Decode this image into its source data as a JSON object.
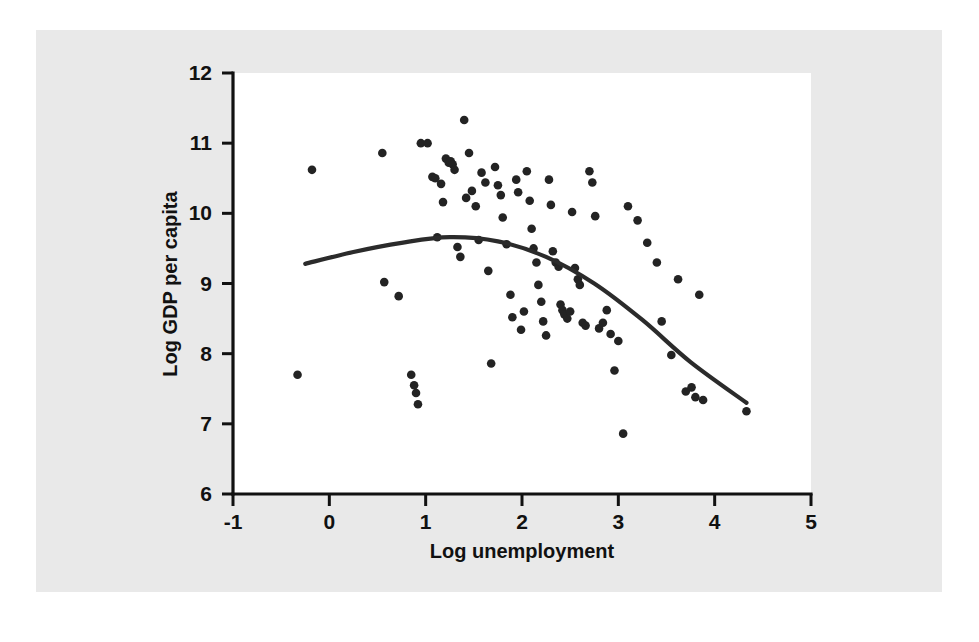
{
  "figure": {
    "background_color": "#e9e9e9",
    "panel_color": "#ffffff",
    "ink_color": "#232323"
  },
  "chart_data": {
    "type": "scatter",
    "title": "",
    "xlabel": "Log unemployment",
    "ylabel": "Log GDP per capita",
    "xlim": [
      -1,
      5
    ],
    "ylim": [
      6,
      12
    ],
    "xticks": [
      -1,
      0,
      1,
      2,
      3,
      4,
      5
    ],
    "xtick_labels": [
      "-1",
      "0",
      "1",
      "2",
      "3",
      "4",
      "5"
    ],
    "yticks": [
      6,
      7,
      8,
      9,
      10,
      11,
      12
    ],
    "ytick_labels": [
      "6",
      "7",
      "8",
      "9",
      "10",
      "11",
      "12"
    ],
    "grid": false,
    "legend": null,
    "marker": "filled-circle",
    "points": [
      [
        -0.33,
        7.7
      ],
      [
        -0.18,
        10.62
      ],
      [
        0.55,
        10.86
      ],
      [
        0.57,
        9.02
      ],
      [
        0.72,
        8.82
      ],
      [
        0.85,
        7.7
      ],
      [
        0.88,
        7.55
      ],
      [
        0.9,
        7.44
      ],
      [
        0.92,
        7.28
      ],
      [
        0.95,
        11.0
      ],
      [
        1.02,
        11.0
      ],
      [
        1.07,
        10.52
      ],
      [
        1.1,
        10.5
      ],
      [
        1.12,
        9.66
      ],
      [
        1.16,
        10.42
      ],
      [
        1.18,
        10.16
      ],
      [
        1.21,
        10.78
      ],
      [
        1.24,
        10.72
      ],
      [
        1.26,
        10.74
      ],
      [
        1.28,
        10.7
      ],
      [
        1.3,
        10.62
      ],
      [
        1.33,
        9.52
      ],
      [
        1.36,
        9.38
      ],
      [
        1.4,
        11.33
      ],
      [
        1.42,
        10.22
      ],
      [
        1.45,
        10.86
      ],
      [
        1.48,
        10.32
      ],
      [
        1.52,
        10.1
      ],
      [
        1.55,
        9.62
      ],
      [
        1.58,
        10.58
      ],
      [
        1.62,
        10.44
      ],
      [
        1.65,
        9.18
      ],
      [
        1.68,
        7.86
      ],
      [
        1.72,
        10.66
      ],
      [
        1.75,
        10.4
      ],
      [
        1.78,
        10.26
      ],
      [
        1.8,
        9.94
      ],
      [
        1.84,
        9.56
      ],
      [
        1.88,
        8.84
      ],
      [
        1.9,
        8.52
      ],
      [
        1.94,
        10.48
      ],
      [
        1.96,
        10.3
      ],
      [
        1.99,
        8.34
      ],
      [
        2.02,
        8.6
      ],
      [
        2.05,
        10.6
      ],
      [
        2.08,
        10.18
      ],
      [
        2.1,
        9.78
      ],
      [
        2.12,
        9.5
      ],
      [
        2.15,
        9.3
      ],
      [
        2.17,
        8.98
      ],
      [
        2.2,
        8.74
      ],
      [
        2.22,
        8.46
      ],
      [
        2.25,
        8.26
      ],
      [
        2.28,
        10.48
      ],
      [
        2.3,
        10.12
      ],
      [
        2.32,
        9.46
      ],
      [
        2.35,
        9.3
      ],
      [
        2.38,
        9.24
      ],
      [
        2.4,
        8.7
      ],
      [
        2.42,
        8.62
      ],
      [
        2.44,
        8.56
      ],
      [
        2.47,
        8.5
      ],
      [
        2.5,
        8.6
      ],
      [
        2.52,
        10.02
      ],
      [
        2.55,
        9.22
      ],
      [
        2.58,
        9.06
      ],
      [
        2.6,
        8.98
      ],
      [
        2.63,
        8.44
      ],
      [
        2.66,
        8.4
      ],
      [
        2.7,
        10.6
      ],
      [
        2.73,
        10.44
      ],
      [
        2.76,
        9.96
      ],
      [
        2.8,
        8.36
      ],
      [
        2.84,
        8.44
      ],
      [
        2.88,
        8.62
      ],
      [
        2.92,
        8.28
      ],
      [
        2.96,
        7.76
      ],
      [
        3.0,
        8.18
      ],
      [
        3.05,
        6.86
      ],
      [
        3.1,
        10.1
      ],
      [
        3.2,
        9.9
      ],
      [
        3.3,
        9.58
      ],
      [
        3.4,
        9.3
      ],
      [
        3.45,
        8.46
      ],
      [
        3.55,
        7.98
      ],
      [
        3.62,
        9.06
      ],
      [
        3.7,
        7.46
      ],
      [
        3.76,
        7.52
      ],
      [
        3.8,
        7.38
      ],
      [
        3.84,
        8.84
      ],
      [
        3.88,
        7.34
      ],
      [
        4.33,
        7.18
      ]
    ],
    "fit_curve": {
      "label": "quadratic fit",
      "x": [
        -0.25,
        0.25,
        0.75,
        1.25,
        1.75,
        2.25,
        2.75,
        3.25,
        3.75,
        4.33
      ],
      "y": [
        9.28,
        9.45,
        9.58,
        9.66,
        9.6,
        9.38,
        9.0,
        8.48,
        7.88,
        7.3
      ]
    }
  }
}
